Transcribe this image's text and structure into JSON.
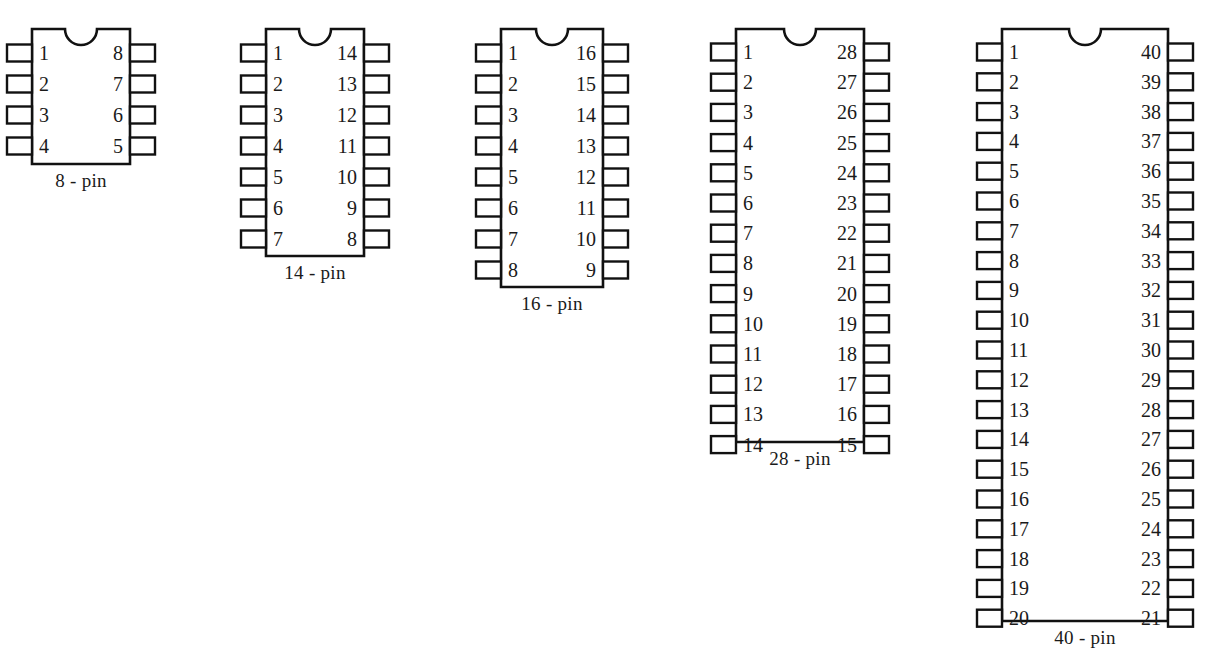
{
  "diagram": {
    "background_color": "#ffffff",
    "line_color": "#111111",
    "text_color": "#1a1a1a",
    "packages": [
      {
        "id": "dip8",
        "label": "8 - pin",
        "pin_count": 8,
        "pins_per_side": 4,
        "left_pins": [
          "1",
          "2",
          "3",
          "4"
        ],
        "right_pins": [
          "8",
          "7",
          "6",
          "5"
        ],
        "body_x": 32,
        "body_y": 29,
        "body_width": 98,
        "body_height": 135,
        "pin_pitch": 31,
        "first_pin_offset": 24,
        "notch": true,
        "label_x": 81,
        "label_y": 170,
        "number_font_size": 20
      },
      {
        "id": "dip14",
        "label": "14 - pin",
        "pin_count": 14,
        "pins_per_side": 7,
        "left_pins": [
          "1",
          "2",
          "3",
          "4",
          "5",
          "6",
          "7"
        ],
        "right_pins": [
          "14",
          "13",
          "12",
          "11",
          "10",
          "9",
          "8"
        ],
        "body_x": 266,
        "body_y": 29,
        "body_width": 98,
        "body_height": 227,
        "pin_pitch": 31,
        "first_pin_offset": 24,
        "notch": true,
        "label_x": 315,
        "label_y": 262,
        "number_font_size": 20
      },
      {
        "id": "dip16",
        "label": "16 - pin",
        "pin_count": 16,
        "pins_per_side": 8,
        "left_pins": [
          "1",
          "2",
          "3",
          "4",
          "5",
          "6",
          "7",
          "8"
        ],
        "right_pins": [
          "16",
          "15",
          "14",
          "13",
          "12",
          "11",
          "10",
          "9"
        ],
        "body_x": 501,
        "body_y": 29,
        "body_width": 102,
        "body_height": 258,
        "pin_pitch": 31,
        "first_pin_offset": 24,
        "notch": true,
        "label_x": 552,
        "label_y": 293,
        "number_font_size": 20
      },
      {
        "id": "dip28",
        "label": "28 - pin",
        "pin_count": 28,
        "pins_per_side": 14,
        "left_pins": [
          "1",
          "2",
          "3",
          "4",
          "5",
          "6",
          "7",
          "8",
          "9",
          "10",
          "11",
          "12",
          "13",
          "14"
        ],
        "right_pins": [
          "28",
          "27",
          "26",
          "25",
          "24",
          "23",
          "22",
          "21",
          "20",
          "19",
          "18",
          "17",
          "16",
          "15"
        ],
        "body_x": 736,
        "body_y": 29,
        "body_width": 128,
        "body_height": 413,
        "pin_pitch": 30.2,
        "first_pin_offset": 23,
        "notch": true,
        "label_x": 800,
        "label_y": 448,
        "number_font_size": 20
      },
      {
        "id": "dip40",
        "label": "40 - pin",
        "pin_count": 40,
        "pins_per_side": 20,
        "left_pins": [
          "1",
          "2",
          "3",
          "4",
          "5",
          "6",
          "7",
          "8",
          "9",
          "10",
          "11",
          "12",
          "13",
          "14",
          "15",
          "16",
          "17",
          "18",
          "19",
          "20"
        ],
        "right_pins": [
          "40",
          "39",
          "38",
          "37",
          "36",
          "35",
          "34",
          "33",
          "32",
          "31",
          "30",
          "29",
          "28",
          "27",
          "26",
          "25",
          "24",
          "23",
          "22",
          "21"
        ],
        "body_x": 1002,
        "body_y": 29,
        "body_width": 166,
        "body_height": 592,
        "pin_pitch": 29.8,
        "first_pin_offset": 23,
        "notch": true,
        "label_x": 1085,
        "label_y": 627,
        "number_font_size": 20
      }
    ],
    "lead": {
      "width": 25,
      "height": 17
    },
    "notch": {
      "radius": 16
    }
  }
}
